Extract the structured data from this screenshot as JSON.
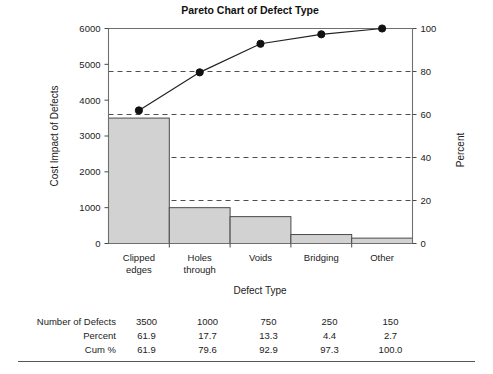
{
  "chart_data": {
    "type": "bar",
    "title": "Pareto Chart of Defect Type",
    "xlabel": "Defect Type",
    "ylabel": "Cost Impact of Defects",
    "y2label": "Percent",
    "categories": [
      "Clipped edges",
      "Holes through",
      "Voids",
      "Bridging",
      "Other"
    ],
    "category_lines": [
      [
        "Clipped",
        "edges"
      ],
      [
        "Holes",
        "through"
      ],
      [
        "Voids"
      ],
      [
        "Bridging"
      ],
      [
        "Other"
      ]
    ],
    "values": [
      3500,
      1000,
      750,
      250,
      150
    ],
    "series": [
      {
        "name": "Number of Defects",
        "values": [
          3500,
          1000,
          750,
          250,
          150
        ]
      },
      {
        "name": "Percent",
        "values": [
          61.9,
          17.7,
          13.3,
          4.4,
          2.7
        ]
      },
      {
        "name": "Cum %",
        "values": [
          61.9,
          79.6,
          92.9,
          97.3,
          100.0
        ]
      }
    ],
    "cumulative_percent": [
      61.9,
      79.6,
      92.9,
      97.3,
      100.0
    ],
    "ylim": [
      0,
      6000
    ],
    "yticks": [
      0,
      1000,
      2000,
      3000,
      4000,
      5000,
      6000
    ],
    "ytick_labels": [
      "0",
      "1000",
      "2000",
      "3000",
      "4000",
      "5000",
      "6000"
    ],
    "y2lim": [
      0,
      100
    ],
    "y2ticks": [
      0,
      20,
      40,
      60,
      80,
      100
    ],
    "y2tick_labels": [
      "0",
      "20",
      "40",
      "60",
      "80",
      "100"
    ],
    "grid": true,
    "grid_axis": "y2",
    "legend": "none",
    "bar_color": "#d2d2d2",
    "line_color": "#222222"
  },
  "table": {
    "rows": [
      {
        "label": "Number of Defects",
        "values": [
          "3500",
          "1000",
          "750",
          "250",
          "150"
        ]
      },
      {
        "label": "Percent",
        "values": [
          "61.9",
          "17.7",
          "13.3",
          "4.4",
          "2.7"
        ]
      },
      {
        "label": "Cum %",
        "values": [
          "61.9",
          "79.6",
          "92.9",
          "97.3",
          "100.0"
        ]
      }
    ]
  }
}
